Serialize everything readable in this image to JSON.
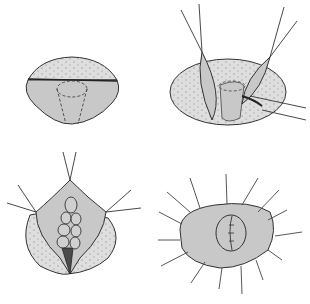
{
  "figure": {
    "colors": {
      "background": "#ffffff",
      "tissue_fill": "#c8c8c8",
      "dotted_fill": "#dcdcdc",
      "stroke": "#333333",
      "dark_segment": "#4a4a4a"
    },
    "panels": [
      {
        "position": "top-left",
        "content": "oval with dotted upper portion, horizontal incision line, dashed cone"
      },
      {
        "position": "top-right",
        "content": "dotted oval with two retracted flaps held by sutures, cone and instrument"
      },
      {
        "position": "bottom-left",
        "content": "flap pulled up by sutures revealing lobulated structure and dark wedge"
      },
      {
        "position": "bottom-right",
        "content": "closed oval with radiating sutures and small sutured circle"
      }
    ]
  }
}
